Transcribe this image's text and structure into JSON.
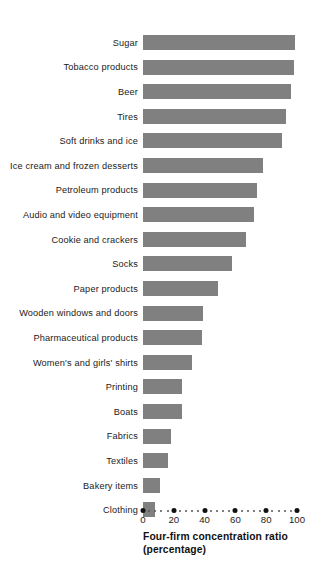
{
  "chart_data": {
    "type": "bar",
    "orientation": "horizontal",
    "title": "",
    "xlabel": "Four-firm concentration ratio (percentage)",
    "ylabel": "",
    "xlim": [
      0,
      100
    ],
    "grid": false,
    "legend": null,
    "bar_color": "#808080",
    "categories": [
      "Sugar",
      "Tobacco  products",
      "Beer",
      "Tires",
      "Soft drinks and ice",
      "Ice cream and frozen desserts",
      "Petroleum products",
      "Audio and video equipment",
      "Cookie and crackers",
      "Socks",
      "Paper products",
      "Wooden windows and doors",
      "Pharmaceutical products",
      "Women's and girls' shirts",
      "Printing",
      "Boats",
      "Fabrics",
      "Textiles",
      "Bakery items",
      "Clothing"
    ],
    "values": [
      99,
      98,
      96,
      93,
      90,
      78,
      74,
      72,
      67,
      58,
      49,
      39,
      38,
      32,
      25,
      25,
      18,
      16,
      11,
      8
    ],
    "xticks": [
      0,
      20,
      40,
      60,
      80,
      100
    ],
    "xticklabels": [
      "0",
      "20",
      "40",
      "60",
      "80",
      "100"
    ]
  },
  "axis": {
    "title_line1": "Four-firm concentration ratio",
    "title_line2": "(percentage)"
  }
}
